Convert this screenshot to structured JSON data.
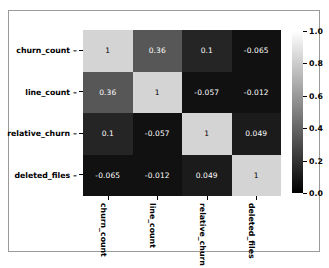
{
  "chart_data": {
    "type": "heatmap",
    "title": "",
    "xlabel": "",
    "ylabel": "",
    "categories": [
      "churn_count",
      "line_count",
      "relative_churn",
      "deleted_files"
    ],
    "x_tick_labels": [
      "churn_count",
      "line_count",
      "relative_churn",
      "deleted_files"
    ],
    "y_tick_labels": [
      "churn_count",
      "line_count",
      "relative_churn",
      "deleted_files"
    ],
    "matrix": [
      [
        1,
        0.36,
        0.1,
        -0.065
      ],
      [
        0.36,
        1,
        -0.057,
        -0.012
      ],
      [
        0.1,
        -0.057,
        1,
        0.049
      ],
      [
        -0.065,
        -0.012,
        0.049,
        1
      ]
    ],
    "cell_labels": [
      [
        "1",
        "0.36",
        "0.1",
        "-0.065"
      ],
      [
        "0.36",
        "1",
        "-0.057",
        "-0.012"
      ],
      [
        "0.1",
        "-0.057",
        "1",
        "0.049"
      ],
      [
        "-0.065",
        "-0.012",
        "0.049",
        "1"
      ]
    ],
    "annotated": true,
    "colormap": "gray",
    "vmin": 0.0,
    "vmax": 1.0,
    "grid": false,
    "legend": "none",
    "colorbar": {
      "position": "right",
      "orientation": "vertical",
      "tick_labels": [
        "0.0",
        "0.2",
        "0.4",
        "0.6",
        "0.8",
        "1.0"
      ],
      "tick_values": [
        0.0,
        0.2,
        0.4,
        0.6,
        0.8,
        1.0
      ],
      "range": [
        0.0,
        1.0
      ],
      "gradient_low_color": "#000000",
      "gradient_high_color": "#ffffff"
    }
  },
  "colors": {
    "figure_background": "#ffffff",
    "figure_border": "#9a9a9a",
    "axis_text": "#000000",
    "cell_text_light": "#ffffff",
    "cell_text_dark": "#000000",
    "diagonal_cell": "#d4d4d4",
    "offdiagonal_cell": "#111111"
  }
}
